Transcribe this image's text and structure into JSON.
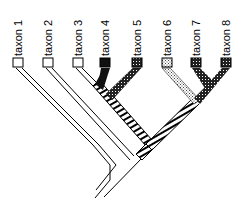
{
  "diagram": {
    "type": "cladogram",
    "taxa": [
      {
        "label": "taxon 1",
        "fill": "white"
      },
      {
        "label": "taxon 2",
        "fill": "white"
      },
      {
        "label": "taxon 3",
        "fill": "white"
      },
      {
        "label": "taxon 4",
        "fill": "black"
      },
      {
        "label": "taxon 5",
        "fill": "dark-dotted"
      },
      {
        "label": "taxon 6",
        "fill": "light-dotted"
      },
      {
        "label": "taxon 7",
        "fill": "dark-dotted"
      },
      {
        "label": "taxon 8",
        "fill": "dark-dotted"
      }
    ],
    "internal_branch_fill": "hatched",
    "colors": {
      "line": "#000000",
      "background": "#ffffff",
      "black": "#111111"
    }
  }
}
